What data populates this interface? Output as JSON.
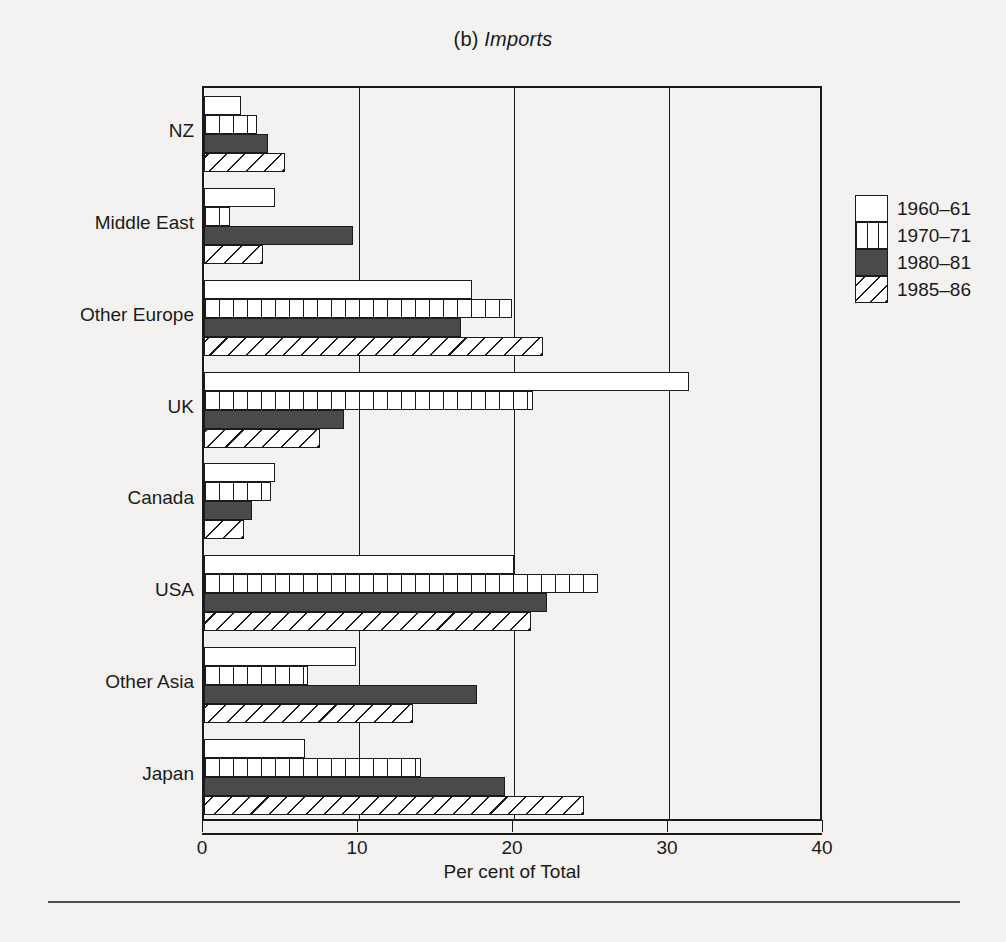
{
  "title": {
    "prefix": "(b) ",
    "emphasis": "Imports"
  },
  "axis": {
    "x_title": "Per cent of Total",
    "x_ticks": [
      "0",
      "10",
      "20",
      "30",
      "40"
    ]
  },
  "legend": {
    "items": [
      {
        "label": "1960–61",
        "swatch": "white-empty"
      },
      {
        "label": "1970–71",
        "swatch": "vertical-hatch"
      },
      {
        "label": "1980–81",
        "swatch": "dark-gray-solid"
      },
      {
        "label": "1985–86",
        "swatch": "diagonal-hatch"
      }
    ]
  },
  "chart_data": {
    "type": "bar",
    "orientation": "horizontal",
    "title": "(b) Imports",
    "xlabel": "Per cent of Total",
    "ylabel": "",
    "xlim": [
      0,
      40
    ],
    "xticks": [
      0,
      10,
      20,
      30,
      40
    ],
    "grid": "vertical",
    "legend_position": "right",
    "categories": [
      "NZ",
      "Middle East",
      "Other Europe",
      "UK",
      "Canada",
      "USA",
      "Other Asia",
      "Japan"
    ],
    "series": [
      {
        "name": "1960–61",
        "values": [
          2.4,
          4.6,
          17.3,
          31.3,
          4.6,
          20.0,
          9.8,
          6.5
        ]
      },
      {
        "name": "1970–71",
        "values": [
          3.4,
          1.7,
          19.9,
          21.2,
          4.3,
          25.4,
          6.7,
          14.0
        ]
      },
      {
        "name": "1980–81",
        "values": [
          4.1,
          9.6,
          16.6,
          9.0,
          3.1,
          22.1,
          17.6,
          19.4
        ]
      },
      {
        "name": "1985–86",
        "values": [
          5.2,
          3.8,
          21.9,
          7.5,
          2.6,
          21.1,
          13.5,
          24.5
        ]
      }
    ]
  },
  "colors": {
    "ink": "#1a1a1a",
    "solid_fill": "#4a4a4a",
    "empty_fill": "#ffffff",
    "page_background": "#f3f2f0"
  }
}
